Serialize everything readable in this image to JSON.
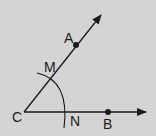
{
  "diagram": {
    "background": "#d4d4d4",
    "stroke": "#1a1a1a",
    "vertex": {
      "label": "C",
      "x": 24,
      "y": 112
    },
    "rays": [
      {
        "name": "ray-CA",
        "from": [
          24,
          112
        ],
        "to": [
          101,
          15
        ]
      },
      {
        "name": "ray-CB",
        "from": [
          24,
          112
        ],
        "to": [
          146,
          112
        ]
      }
    ],
    "points": [
      {
        "label": "A",
        "x": 76,
        "y": 45
      },
      {
        "label": "B",
        "x": 108,
        "y": 112
      }
    ],
    "arc_points": [
      {
        "label": "M",
        "x": 51,
        "y": 78
      },
      {
        "label": "N",
        "x": 69,
        "y": 112
      }
    ],
    "labels": {
      "C": "C",
      "A": "A",
      "M": "M",
      "N": "N",
      "B": "B"
    }
  }
}
